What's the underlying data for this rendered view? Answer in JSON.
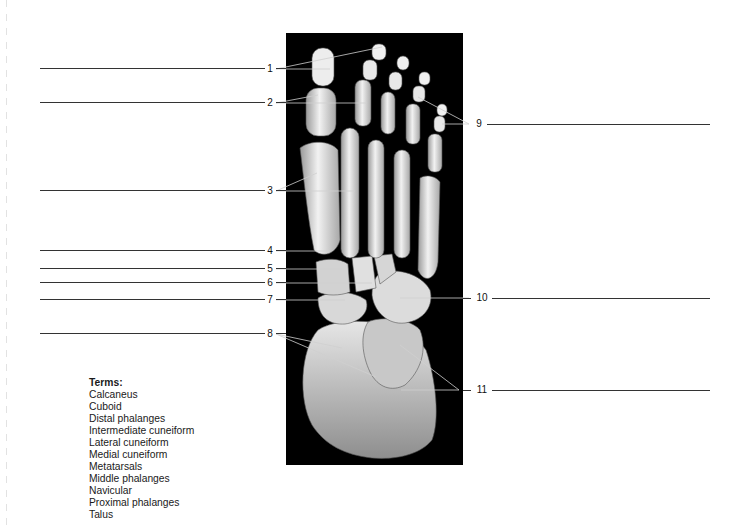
{
  "figure": {
    "photo_bg": "#000000",
    "line_color": "#333333"
  },
  "labels": [
    {
      "id": "1",
      "text": "1",
      "side": "left",
      "y": 69
    },
    {
      "id": "2",
      "text": "2",
      "side": "left",
      "y": 103
    },
    {
      "id": "3",
      "text": "3",
      "side": "left",
      "y": 191
    },
    {
      "id": "4",
      "text": "4",
      "side": "left",
      "y": 251
    },
    {
      "id": "5",
      "text": "5",
      "side": "left",
      "y": 269
    },
    {
      "id": "6",
      "text": "6",
      "side": "left",
      "y": 283
    },
    {
      "id": "7",
      "text": "7",
      "side": "left",
      "y": 300
    },
    {
      "id": "8",
      "text": "8",
      "side": "left",
      "y": 334
    },
    {
      "id": "9",
      "text": "9",
      "side": "right",
      "y": 124
    },
    {
      "id": "10",
      "text": "10",
      "side": "right",
      "y": 298
    },
    {
      "id": "11",
      "text": "11",
      "side": "right",
      "y": 390
    }
  ],
  "terms": {
    "heading": "Terms:",
    "items": [
      "Calcaneus",
      "Cuboid",
      "Distal phalanges",
      "Intermediate cuneiform",
      "Lateral cuneiform",
      "Medial cuneiform",
      "Metatarsals",
      "Middle phalanges",
      "Navicular",
      "Proximal phalanges",
      "Talus"
    ]
  }
}
